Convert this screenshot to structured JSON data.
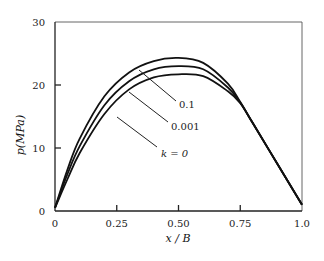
{
  "chart_data": {
    "type": "line",
    "title": "",
    "xlabel": "x / B",
    "ylabel": "p(MPa)",
    "xlim": [
      0,
      1.0
    ],
    "ylim": [
      0,
      30
    ],
    "grid": false,
    "legend": "inline leader-line labels",
    "x_ticks": [
      {
        "value": 0,
        "label": "0"
      },
      {
        "value": 0.25,
        "label": "0.25"
      },
      {
        "value": 0.5,
        "label": "0.50"
      },
      {
        "value": 0.75,
        "label": "0.75"
      },
      {
        "value": 1.0,
        "label": "1.0"
      }
    ],
    "y_ticks": [
      {
        "value": 0,
        "label": "0"
      },
      {
        "value": 10,
        "label": "10"
      },
      {
        "value": 20,
        "label": "20"
      },
      {
        "value": 30,
        "label": "30"
      }
    ],
    "x": [
      0,
      0.05,
      0.1,
      0.2,
      0.3,
      0.4,
      0.5,
      0.6,
      0.7,
      0.75,
      0.8,
      0.9,
      1.0
    ],
    "series": [
      {
        "name": "0.1",
        "values": [
          0.5,
          6.5,
          11.5,
          18.2,
          22.0,
          23.8,
          24.3,
          23.5,
          20.2,
          17.3,
          14.0,
          7.5,
          1.0
        ]
      },
      {
        "name": "0.001",
        "values": [
          0.5,
          5.8,
          10.3,
          16.8,
          20.6,
          22.5,
          23.0,
          22.5,
          19.6,
          17.2,
          14.0,
          7.5,
          1.0
        ]
      },
      {
        "name": "k=0",
        "values": [
          0.5,
          5.0,
          9.2,
          15.4,
          19.3,
          21.2,
          21.7,
          21.4,
          19.0,
          17.1,
          14.0,
          7.5,
          1.0
        ]
      }
    ],
    "annotations": [
      {
        "text": "0.1",
        "target_series": "0.1"
      },
      {
        "text": "0.001",
        "target_series": "0.001"
      },
      {
        "text": "k=0",
        "target_series": "k=0"
      }
    ]
  },
  "labels": {
    "ylabel": "p(MPa)",
    "xlabel": "x / B",
    "curve_0": "0.1",
    "curve_1": "0.001",
    "curve_2": "k = 0"
  }
}
